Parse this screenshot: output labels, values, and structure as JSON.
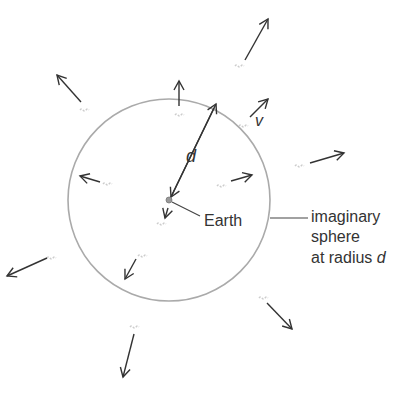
{
  "diagram": {
    "labels": {
      "earth": "Earth",
      "sphere_line1": "imaginary",
      "sphere_line2": "sphere",
      "sphere_line3_prefix": "at radius ",
      "sphere_line3_var": "d",
      "distance": "d",
      "velocity": "v"
    },
    "colors": {
      "arrow": "#333333",
      "sphere": "#aaaaaa",
      "galaxy": "#cccccc",
      "earth": "#999999",
      "text": "#333333"
    },
    "sphere": {
      "cx": 169,
      "cy": 200,
      "r": 101
    },
    "earth": {
      "cx": 169,
      "cy": 200,
      "r": 3
    },
    "galaxy_arrows": [
      {
        "id": "top-left-outer",
        "x1": 81,
        "y1": 102,
        "x2": 57,
        "y2": 75,
        "gx": 85,
        "gy": 110
      },
      {
        "id": "top-inner",
        "x1": 179,
        "y1": 106,
        "x2": 179,
        "y2": 81,
        "gx": 180,
        "gy": 115
      },
      {
        "id": "top-right-far",
        "x1": 245,
        "y1": 60,
        "x2": 268,
        "y2": 19,
        "gx": 240,
        "gy": 66
      },
      {
        "id": "right-edge",
        "x1": 250,
        "y1": 117,
        "x2": 268,
        "y2": 99,
        "gx": 244,
        "gy": 126
      },
      {
        "id": "right-outer",
        "x1": 310,
        "y1": 163,
        "x2": 344,
        "y2": 153,
        "gx": 300,
        "gy": 166
      },
      {
        "id": "right-inner",
        "x1": 231,
        "y1": 181,
        "x2": 252,
        "y2": 175,
        "gx": 222,
        "gy": 186
      },
      {
        "id": "left-inner",
        "x1": 100,
        "y1": 182,
        "x2": 80,
        "y2": 176,
        "gx": 108,
        "gy": 184
      },
      {
        "id": "bottom-near-earth",
        "x1": 168,
        "y1": 208,
        "x2": 165,
        "y2": 218,
        "gx": 162,
        "gy": 224
      },
      {
        "id": "bottom-inner",
        "x1": 136,
        "y1": 259,
        "x2": 125,
        "y2": 279,
        "gx": 143,
        "gy": 256
      },
      {
        "id": "left-outer",
        "x1": 47,
        "y1": 258,
        "x2": 7,
        "y2": 276,
        "gx": 52,
        "gy": 258
      },
      {
        "id": "bottom-right-outer",
        "x1": 267,
        "y1": 303,
        "x2": 292,
        "y2": 329,
        "gx": 264,
        "gy": 298
      },
      {
        "id": "bottom-outer",
        "x1": 134,
        "y1": 334,
        "x2": 123,
        "y2": 377,
        "gx": 135,
        "gy": 327
      }
    ]
  }
}
